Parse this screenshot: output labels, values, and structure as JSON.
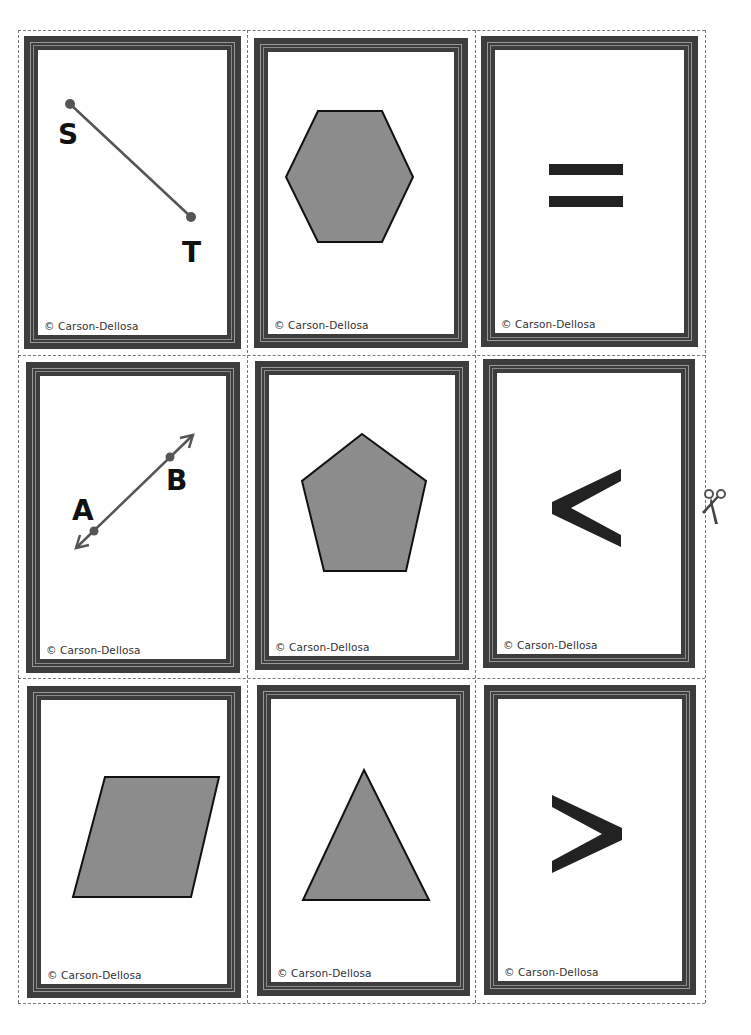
{
  "sheet": {
    "colors": {
      "frame": "#3d3d3d",
      "frame_stripe": "#9a9a9a",
      "shape_fill": "#8c8c8c",
      "shape_stroke": "#111111",
      "symbol": "#222222",
      "point": "#555555",
      "cut_line": "#777777"
    },
    "scissors_icon": "scissors-icon",
    "cards": [
      {
        "id": "line-segment-st",
        "type": "line-segment",
        "labels": [
          "S",
          "T"
        ],
        "copyright": "© Carson-Dellosa"
      },
      {
        "id": "hexagon",
        "type": "hexagon",
        "copyright": "© Carson-Dellosa"
      },
      {
        "id": "equals",
        "type": "symbol",
        "symbol": "=",
        "copyright": "© Carson-Dellosa"
      },
      {
        "id": "line-ab",
        "type": "line",
        "labels": [
          "A",
          "B"
        ],
        "copyright": "© Carson-Dellosa"
      },
      {
        "id": "pentagon",
        "type": "pentagon",
        "copyright": "© Carson-Dellosa"
      },
      {
        "id": "less-than",
        "type": "symbol",
        "symbol": "<",
        "copyright": "© Carson-Dellosa"
      },
      {
        "id": "parallelogram",
        "type": "parallelogram",
        "copyright": "© Carson-Dellosa"
      },
      {
        "id": "triangle",
        "type": "triangle",
        "copyright": "© Carson-Dellosa"
      },
      {
        "id": "greater-than",
        "type": "symbol",
        "symbol": ">",
        "copyright": "© Carson-Dellosa"
      }
    ]
  }
}
